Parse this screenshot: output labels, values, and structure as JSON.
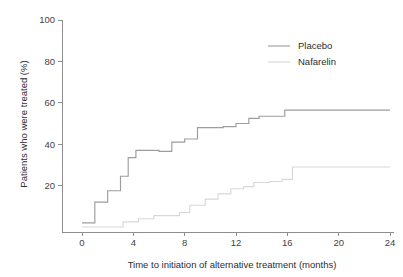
{
  "chart_data": {
    "type": "line",
    "subtype": "step",
    "title": "",
    "xlabel": "Time to initiation of alternative treatment (months)",
    "ylabel": "Patients who were treated (%)",
    "xlim": [
      0,
      24
    ],
    "ylim": [
      0,
      100
    ],
    "xticks": [
      0,
      4,
      8,
      12,
      16,
      20,
      24
    ],
    "yticks": [
      20,
      40,
      60,
      80,
      100
    ],
    "xtick_labels": [
      "0",
      "4",
      "8",
      "12",
      "16",
      "20",
      "24"
    ],
    "ytick_labels": [
      "20",
      "40",
      "60",
      "80",
      "100"
    ],
    "grid": false,
    "legend_position": "top-right",
    "series": [
      {
        "name": "Placebo",
        "color": "#9d9d9d",
        "x": [
          0,
          1,
          1,
          2,
          2,
          3,
          3,
          3.6,
          3.6,
          4.2,
          4.2,
          5,
          5,
          6,
          6,
          7,
          7,
          8,
          8,
          9,
          9,
          11,
          11,
          12,
          12,
          13,
          13,
          13.8,
          13.8,
          15.8,
          15.8,
          24
        ],
        "y": [
          2,
          2,
          12,
          12,
          17.5,
          17.5,
          24.5,
          24.5,
          33.5,
          33.5,
          37,
          37,
          36.5,
          36.5,
          41,
          41,
          42.5,
          42.5,
          42.5,
          42.5,
          48,
          48,
          48.5,
          48.5,
          50,
          50,
          52.5,
          52.5,
          53.5,
          53.5,
          56.5,
          56.5
        ],
        "steps": [
          {
            "month": 0,
            "percent": 2
          },
          {
            "month": 1,
            "percent": 12
          },
          {
            "month": 2,
            "percent": 17.5
          },
          {
            "month": 3,
            "percent": 24.5
          },
          {
            "month": 3.6,
            "percent": 33.5
          },
          {
            "month": 4.2,
            "percent": 37
          },
          {
            "month": 6,
            "percent": 36.5
          },
          {
            "month": 7,
            "percent": 41
          },
          {
            "month": 8,
            "percent": 42.5
          },
          {
            "month": 9,
            "percent": 48
          },
          {
            "month": 11,
            "percent": 48.5
          },
          {
            "month": 12,
            "percent": 50
          },
          {
            "month": 13,
            "percent": 52.5
          },
          {
            "month": 13.8,
            "percent": 53.5
          },
          {
            "month": 15.8,
            "percent": 56.5
          },
          {
            "month": 24,
            "percent": 56.5
          }
        ],
        "final_value": 56.5
      },
      {
        "name": "Nafarelin",
        "color": "#d7d7d7",
        "x": [
          0,
          3.2,
          3.2,
          4.4,
          4.4,
          5.6,
          5.6,
          7.6,
          7.6,
          8.4,
          8.4,
          9.6,
          9.6,
          10.6,
          10.6,
          11.6,
          11.6,
          12.6,
          12.6,
          13.4,
          13.4,
          14.6,
          14.6,
          15.6,
          15.6,
          16.4,
          16.4,
          24
        ],
        "y": [
          0,
          0,
          2.5,
          2.5,
          4,
          4,
          5.5,
          5.5,
          7,
          7,
          10.5,
          10.5,
          13.5,
          13.5,
          16,
          16,
          18.5,
          18.5,
          19.5,
          19.5,
          21.5,
          21.5,
          22,
          22,
          23,
          23,
          29,
          29
        ],
        "steps": [
          {
            "month": 0,
            "percent": 0
          },
          {
            "month": 3.2,
            "percent": 2.5
          },
          {
            "month": 4.4,
            "percent": 4
          },
          {
            "month": 5.6,
            "percent": 5.5
          },
          {
            "month": 7.6,
            "percent": 7
          },
          {
            "month": 8.4,
            "percent": 10.5
          },
          {
            "month": 9.6,
            "percent": 13.5
          },
          {
            "month": 10.6,
            "percent": 16
          },
          {
            "month": 11.6,
            "percent": 18.5
          },
          {
            "month": 12.6,
            "percent": 19.5
          },
          {
            "month": 13.4,
            "percent": 21.5
          },
          {
            "month": 14.6,
            "percent": 22
          },
          {
            "month": 15.6,
            "percent": 23
          },
          {
            "month": 16.4,
            "percent": 29
          },
          {
            "month": 24,
            "percent": 29
          }
        ],
        "final_value": 29
      }
    ]
  },
  "legend": {
    "items": [
      {
        "label": "Placebo",
        "color": "#9d9d9d"
      },
      {
        "label": "Nafarelin",
        "color": "#d7d7d7"
      }
    ]
  },
  "colors": {
    "placebo": "#9d9d9d",
    "nafarelin": "#d7d7d7",
    "axis": "#8e8e8e",
    "text": "#2e2e2e",
    "background": "#ffffff"
  }
}
